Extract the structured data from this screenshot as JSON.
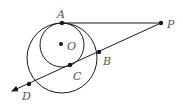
{
  "diagram": {
    "colors": {
      "stroke": "#1a1a1a",
      "label": "#555555",
      "background": "#ffffff"
    },
    "points": {
      "A": {
        "label": "A",
        "x": 62,
        "y": 23
      },
      "O": {
        "label": "O",
        "x": 61,
        "y": 44
      },
      "P": {
        "label": "P",
        "x": 161,
        "y": 23
      },
      "B": {
        "label": "B",
        "x": 99,
        "y": 52
      },
      "C": {
        "label": "C",
        "x": 70,
        "y": 65
      },
      "D": {
        "label": "D",
        "x": 29,
        "y": 84
      }
    },
    "circles": [
      {
        "name": "small-circle",
        "cx": 62,
        "cy": 45,
        "r": 22
      },
      {
        "name": "large-circle",
        "cx": 62,
        "cy": 58,
        "r": 35
      }
    ]
  }
}
